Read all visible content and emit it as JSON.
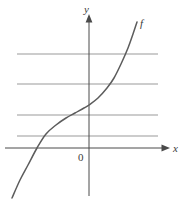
{
  "figure": {
    "background_color": "#ffffff",
    "width": 187,
    "height": 209
  },
  "labels": {
    "y_axis": "y",
    "x_axis": "x",
    "curve": "f",
    "origin": "0"
  },
  "colors": {
    "axis": "#4a4a4a",
    "gridline": "#9a9a9a",
    "curve": "#5c5c5c",
    "text": "#3a3a3a"
  },
  "chart_data": {
    "type": "line",
    "title": "",
    "xlabel": "x",
    "ylabel": "y",
    "legend": [
      "f"
    ],
    "legend_position": "curve-end-top-right",
    "grid": true,
    "grid_orientation": "horizontal",
    "gridlines_y_px": [
      54,
      84,
      115,
      136
    ],
    "gridline_x_extent_px": [
      17,
      158
    ],
    "axes": {
      "y_axis_x_px": 89,
      "y_axis_top_px": 18,
      "y_axis_bottom_px": 196,
      "x_axis_y_px": 148,
      "x_axis_left_px": 5,
      "x_axis_right_px": 168,
      "arrows": [
        "y-axis-up",
        "x-axis-right"
      ],
      "tick_labels": [
        "0"
      ]
    },
    "series": [
      {
        "name": "f",
        "description": "Monotonically increasing curve, concave up at the right, concave down at the left, crossing the x-axis left of the origin and the y-axis above the origin",
        "points_px": [
          [
            12,
            198
          ],
          [
            20,
            180
          ],
          [
            28,
            165
          ],
          [
            37,
            148
          ],
          [
            46,
            134
          ],
          [
            56,
            125
          ],
          [
            66,
            118
          ],
          [
            75,
            113
          ],
          [
            84,
            108
          ],
          [
            89,
            105
          ],
          [
            98,
            98
          ],
          [
            107,
            88
          ],
          [
            114,
            78
          ],
          [
            121,
            64
          ],
          [
            128,
            48
          ],
          [
            133,
            34
          ],
          [
            137,
            22
          ]
        ]
      }
    ]
  }
}
